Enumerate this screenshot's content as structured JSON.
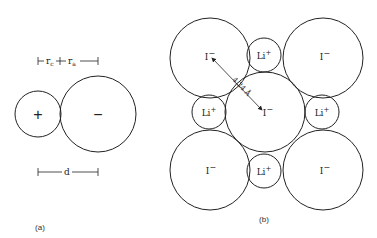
{
  "panel_a": {
    "caption": "(a)",
    "cation_sign": "+",
    "anion_sign": "−",
    "radius_cation_label": "r",
    "radius_cation_sub": "c",
    "radius_anion_label": "r",
    "radius_anion_sub": "a",
    "distance_label": "d"
  },
  "panel_b": {
    "caption": "(b)",
    "iodide_label": "I",
    "iodide_charge": "−",
    "lithium_label": "Li",
    "lithium_charge": "+",
    "distance_label": "4.24 Å"
  },
  "colors": {
    "stroke": "#222222",
    "background": "#ffffff"
  }
}
